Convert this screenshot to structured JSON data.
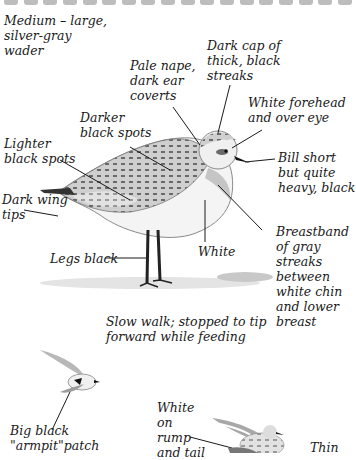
{
  "page": {
    "top_border_ticks": 18
  },
  "labels": {
    "size": "Medium – large,\nsilver-gray\nwader",
    "cap": "Dark cap of\nthick, black\nstreaks",
    "nape": "Pale nape,\ndark ear\ncoverts",
    "forehead": "White forehead\nand over eye",
    "darker_spots": "Darker\nblack spots",
    "lighter_spots": "Lighter\nblack spots",
    "bill": "Bill short\nbut quite\nheavy, black",
    "wing_tips": "Dark wing\ntips",
    "breastband": "Breastband\nof gray\nstreaks\nbetween\nwhite chin\nand lower\nbreast",
    "white_belly": "White",
    "legs": "Legs black",
    "walk": "Slow walk; stopped to tip\nforward while feeding",
    "armpit": "Big black\n\"armpit\"patch",
    "rump": "White\non\nrump\nand tail",
    "thin": "Thin"
  },
  "colors": {
    "ink": "#1a1a1a",
    "plumage_gray": "#9a9a9a",
    "plumage_dark": "#555555",
    "ground": "#d6d6d6"
  }
}
